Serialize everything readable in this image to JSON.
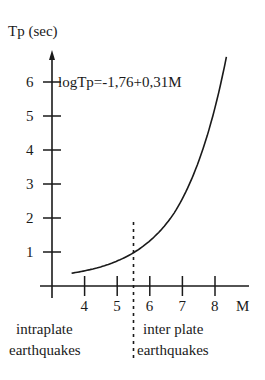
{
  "chart_data": {
    "type": "line",
    "title": "",
    "xlabel": "M",
    "ylabel": "Tp (sec)",
    "annotation": "logTp=-1,76+0,31M",
    "x_ticks": [
      "4",
      "5",
      "6",
      "7",
      "8"
    ],
    "y_ticks": [
      "1",
      "2",
      "3",
      "4",
      "5",
      "6"
    ],
    "xlim": [
      3,
      8.9
    ],
    "ylim": [
      0,
      7
    ],
    "grid": false,
    "formula": {
      "intercept": -1.76,
      "slope": 0.31,
      "log_base": 10
    },
    "series": [
      {
        "name": "Tp vs M",
        "x": [
          3.6,
          4.0,
          4.5,
          5.0,
          5.5,
          6.0,
          6.5,
          7.0,
          7.5,
          8.0,
          8.35
        ],
        "y": [
          0.23,
          0.3,
          0.43,
          0.61,
          0.88,
          1.26,
          1.8,
          2.57,
          3.67,
          5.25,
          6.74
        ]
      }
    ],
    "divider": {
      "x": 5.5,
      "style": "dashed"
    },
    "regions": [
      {
        "label_line1": "intraplate",
        "label_line2": "earthquakes",
        "side": "left"
      },
      {
        "label_line1": "inter plate",
        "label_line2": "earthquakes",
        "side": "right"
      }
    ]
  }
}
